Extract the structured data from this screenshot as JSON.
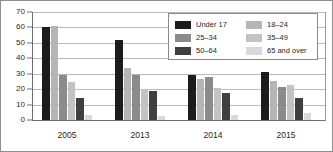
{
  "chart_data": {
    "type": "bar",
    "title": "",
    "xlabel": "",
    "ylabel": "",
    "categories": [
      "2005",
      "2013",
      "2014",
      "2015"
    ],
    "ylim": [
      0,
      70
    ],
    "yticks": [
      0,
      10,
      20,
      30,
      40,
      50,
      60,
      70
    ],
    "ytick_labels": [
      "0",
      "10",
      "20",
      "30",
      "40",
      "50",
      "60",
      "70"
    ],
    "grid": true,
    "legend_position": "upper right",
    "series": [
      {
        "name": "Under 17",
        "color": "#1c1c1c",
        "values": [
          60.0,
          52.0,
          29.5,
          31.0
        ]
      },
      {
        "name": "18–24",
        "color": "#b5b5b5",
        "values": [
          61.0,
          34.0,
          26.5,
          25.0
        ]
      },
      {
        "name": "25–34",
        "color": "#8b8b8b",
        "values": [
          29.5,
          29.5,
          28.0,
          21.5
        ]
      },
      {
        "name": "35–49",
        "color": "#c3c3c3",
        "values": [
          24.5,
          20.0,
          21.0,
          22.5
        ]
      },
      {
        "name": "50–64",
        "color": "#3f3f3f",
        "values": [
          14.5,
          18.5,
          17.5,
          14.0
        ]
      },
      {
        "name": "65 and over",
        "color": "#d9d9d9",
        "values": [
          3.0,
          2.8,
          3.2,
          4.5
        ]
      }
    ]
  },
  "legend": {
    "entries": [
      {
        "label": "Under 17",
        "color": "#1c1c1c"
      },
      {
        "label": "18–24",
        "color": "#b5b5b5"
      },
      {
        "label": "25–34",
        "color": "#8b8b8b"
      },
      {
        "label": "35–49",
        "color": "#c3c3c3"
      },
      {
        "label": "50–64",
        "color": "#3f3f3f"
      },
      {
        "label": "65 and over",
        "color": "#d9d9d9"
      }
    ]
  },
  "colors": {
    "axis": "#6e6e6e",
    "grid": "#b9b9b9",
    "text": "#1f1f1f",
    "frame": "#8f8f8f",
    "background": "#ffffff"
  }
}
